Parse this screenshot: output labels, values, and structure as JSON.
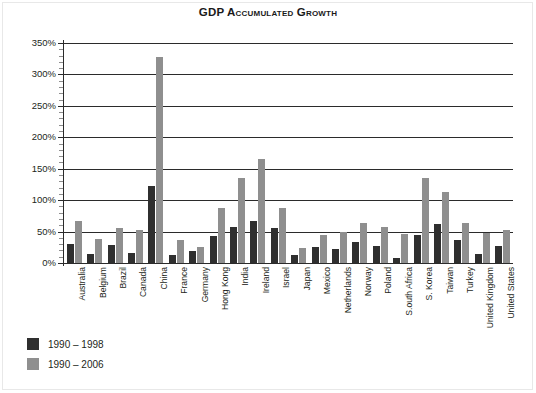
{
  "chart_data": {
    "type": "bar",
    "title": "GDP Accumulated Growth",
    "xlabel": "",
    "ylabel": "",
    "ylim": [
      0,
      350
    ],
    "ytick_step": 50,
    "ytick_minor_step": 10,
    "grid": true,
    "legend_position": "bottom-left",
    "ytick_labels": [
      "350%",
      "300%",
      "250%",
      "200%",
      "150%",
      "100%",
      "50%",
      "0%"
    ],
    "ytick_values": [
      350,
      300,
      250,
      200,
      150,
      100,
      50,
      0
    ],
    "categories": [
      "Australia",
      "Belgium",
      "Brazil",
      "Canada",
      "China",
      "France",
      "Germany",
      "Hong Kong",
      "India",
      "Ireland",
      "Israel",
      "Japan",
      "Mexico",
      "Netherlands",
      "Norway",
      "Poland",
      "S.outh Africa",
      "S. Korea",
      "Taiwan",
      "Turkey",
      "United Kingdom",
      "United States"
    ],
    "series": [
      {
        "name": "1990 – 1998",
        "color": "#2f2f2f",
        "values": [
          30,
          14,
          28,
          16,
          123,
          13,
          19,
          43,
          57,
          67,
          55,
          12,
          25,
          22,
          34,
          27,
          8,
          44,
          62,
          37,
          15,
          27
        ]
      },
      {
        "name": "1990 – 2006",
        "color": "#8f8f8f",
        "values": [
          67,
          39,
          55,
          53,
          328,
          37,
          26,
          87,
          136,
          166,
          88,
          24,
          44,
          49,
          63,
          57,
          46,
          135,
          113,
          63,
          48,
          52
        ]
      }
    ]
  },
  "legend": {
    "items": [
      {
        "label": "1990 – 1998",
        "series": 0
      },
      {
        "label": "1990 – 2006",
        "series": 1
      }
    ]
  }
}
